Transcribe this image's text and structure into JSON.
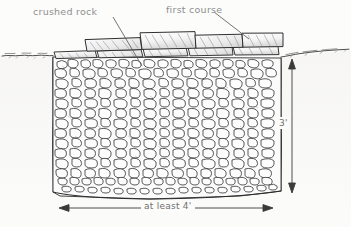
{
  "figure": {
    "background_color": "#fcfcfb",
    "ink_color": "#2b2b2b",
    "label_color": "#8e8e8e",
    "dimension_color": "#6f6f6f"
  },
  "annotations": {
    "crushed_rock": {
      "text": "crushed rock",
      "leader_from": [
        113,
        17
      ],
      "leader_to": [
        142,
        66
      ]
    },
    "first_course": {
      "text": "first course",
      "leader_from": [
        214,
        12
      ],
      "leader_to": [
        249,
        39
      ]
    }
  },
  "dimensions": {
    "width": {
      "text": "at least 4'",
      "axis": "horizontal",
      "from": [
        60,
        208
      ],
      "to": [
        272,
        208
      ]
    },
    "depth": {
      "text": "3'",
      "axis": "vertical",
      "from": [
        292,
        62
      ],
      "to": [
        292,
        190
      ]
    }
  },
  "regions": {
    "ground_line_label": "grade / ground surface",
    "trench_fill_label": "crushed rock trench fill",
    "stone_course_label": "first course of wall stones"
  }
}
